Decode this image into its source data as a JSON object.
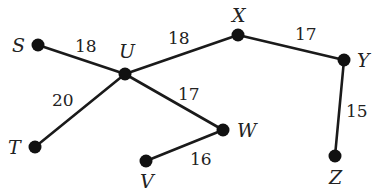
{
  "diagram": {
    "type": "weighted-graph",
    "nodes": [
      {
        "id": "S",
        "label": "S",
        "x": 38,
        "y": 45,
        "label_x": 12,
        "label_y": 52
      },
      {
        "id": "U",
        "label": "U",
        "x": 125,
        "y": 74,
        "label_x": 119,
        "label_y": 58
      },
      {
        "id": "X",
        "label": "X",
        "x": 238,
        "y": 35,
        "label_x": 232,
        "label_y": 22
      },
      {
        "id": "Y",
        "label": "Y",
        "x": 344,
        "y": 60,
        "label_x": 357,
        "label_y": 67
      },
      {
        "id": "T",
        "label": "T",
        "x": 35,
        "y": 147,
        "label_x": 8,
        "label_y": 154
      },
      {
        "id": "W",
        "label": "W",
        "x": 223,
        "y": 130,
        "label_x": 237,
        "label_y": 137
      },
      {
        "id": "V",
        "label": "V",
        "x": 146,
        "y": 161,
        "label_x": 140,
        "label_y": 188
      },
      {
        "id": "Z",
        "label": "Z",
        "x": 335,
        "y": 156,
        "label_x": 329,
        "label_y": 184
      }
    ],
    "edges": [
      {
        "from": "S",
        "to": "U",
        "weight": "18",
        "label_x": 75,
        "label_y": 52
      },
      {
        "from": "U",
        "to": "X",
        "weight": "18",
        "label_x": 168,
        "label_y": 44
      },
      {
        "from": "X",
        "to": "Y",
        "weight": "17",
        "label_x": 295,
        "label_y": 40
      },
      {
        "from": "Y",
        "to": "Z",
        "weight": "15",
        "label_x": 346,
        "label_y": 117
      },
      {
        "from": "U",
        "to": "T",
        "weight": "20",
        "label_x": 52,
        "label_y": 106
      },
      {
        "from": "U",
        "to": "W",
        "weight": "17",
        "label_x": 178,
        "label_y": 100
      },
      {
        "from": "W",
        "to": "V",
        "weight": "16",
        "label_x": 190,
        "label_y": 165
      }
    ],
    "colors": {
      "edge": "#1a1a1a",
      "node": "#111111",
      "text": "#222222",
      "background": "#ffffff"
    }
  }
}
